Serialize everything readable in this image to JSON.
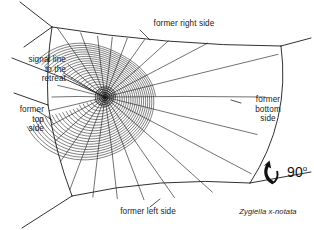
{
  "figure": {
    "kind": "spider-web-diagram",
    "species": "Zygiella x-notata",
    "background_color": "#ffffff",
    "line_color": "#1a1a1a",
    "text_color": "#1a1a1a",
    "width": 314,
    "height": 230
  },
  "labels": {
    "signal_line": "signal line\nto the\nretreat",
    "former_top_side": "former\ntop\nside",
    "former_right_side": "former right side",
    "former_bottom_side": "former\nbottom\nside",
    "former_left_side": "former left side",
    "species_name": "Zygiella x-notata",
    "rotation_angle": "90",
    "rotation_degree_symbol": "o"
  },
  "diagram_data": {
    "type": "orb-web-schematic",
    "hub": {
      "x": 105,
      "y": 97
    },
    "free_sector_degrees": [
      163,
      205
    ],
    "signal_line_endpoint": {
      "x": 12,
      "y": 58
    },
    "frame_anchors": [
      {
        "name": "top-left-anchor",
        "x": 52,
        "y": 27
      },
      {
        "name": "left-anchor",
        "x": 48,
        "y": 105
      },
      {
        "name": "bottom-left-anchor",
        "x": 72,
        "y": 196
      },
      {
        "name": "bottom-right-anchor",
        "x": 250,
        "y": 183
      },
      {
        "name": "right-anchor",
        "x": 281,
        "y": 46
      }
    ],
    "radii_count": 26,
    "spiral_turn_count": 22,
    "spiral_outer_radius_px": 62,
    "spiral_inner_radius_px": 3,
    "notes": "Orb web drawn rotated 90 degrees; labels mark original orientation of each web side before rotation."
  }
}
